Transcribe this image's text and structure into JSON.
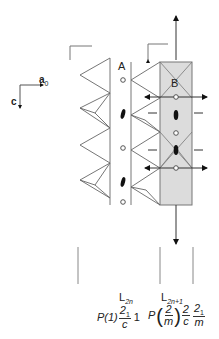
{
  "axes": {
    "a_label": "a",
    "a_subscript": "0",
    "c_label": "c"
  },
  "sites": {
    "A": "A",
    "B": "B"
  },
  "layers": [
    {
      "label_main": "L",
      "label_sub": "2n",
      "symbol": {
        "prefix": "P(1)",
        "frac_num": "2",
        "frac_num_sub": "1",
        "frac_den": "c",
        "suffix": "1"
      }
    },
    {
      "label_main": "L",
      "label_sub": "2n+1",
      "symbol": {
        "prefix": "P",
        "paren_num": "2",
        "paren_den": "m",
        "frac2_num": "2",
        "frac2_den": "c",
        "frac3_num": "2",
        "frac3_num_sub": "1",
        "frac3_den": "m"
      }
    }
  ],
  "colors": {
    "line": "#555555",
    "fill_rect": "#dcdcdc",
    "arrow": "#111111"
  }
}
